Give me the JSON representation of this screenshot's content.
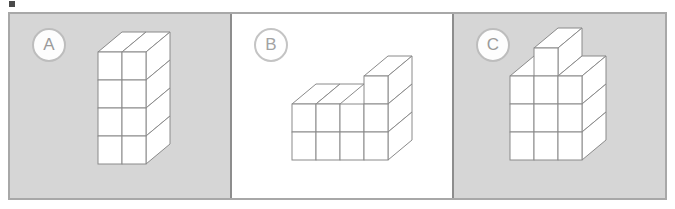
{
  "figure": {
    "background_color": "#d6d6d6",
    "border_color": "#a8a8a8",
    "divider_color": "#8d8d8d",
    "cube_line_color": "#8a8a8a",
    "cube_fill_color": "#ffffff",
    "highlight_background": "#ffffff"
  },
  "panels": [
    {
      "label": "A",
      "background": "#d6d6d6",
      "selected": false,
      "structure": {
        "description": "rectangular tower of unit cubes",
        "columns": 2,
        "rows": 4,
        "depth": 1,
        "heights": [
          4,
          4
        ],
        "visible_front_cubes": 8,
        "total_cubes": 8
      }
    },
    {
      "label": "B",
      "background": "#ffffff",
      "selected": true,
      "structure": {
        "description": "staircase shape, two rows high with one extra cube on the right column",
        "columns": 3,
        "rows": 3,
        "depth": 1,
        "heights": [
          2,
          2,
          3
        ],
        "visible_front_cubes": 7,
        "total_cubes": 7
      }
    },
    {
      "label": "C",
      "background": "#d6d6d6",
      "selected": false,
      "structure": {
        "description": "three by three block with one extra cube on top of the middle column",
        "columns": 3,
        "rows": 4,
        "depth": 1,
        "heights": [
          3,
          4,
          3
        ],
        "visible_front_cubes": 10,
        "total_cubes": 10
      }
    }
  ],
  "marks": {
    "top_left_artifact": "small dark square fragment at top-left edge"
  }
}
